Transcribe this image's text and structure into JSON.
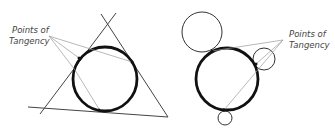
{
  "figures": [
    {
      "name": "circle-inscribed-in-triangle",
      "label_line1": "Points of",
      "label_line2": "Tangency"
    },
    {
      "name": "circle-tangent-to-circles",
      "label_line1": "Points of",
      "label_line2": "Tangency"
    }
  ],
  "colors": {
    "main_circle": "#111111",
    "lines": "#444444",
    "pointer_lines": "#888888",
    "label": "#444444"
  }
}
